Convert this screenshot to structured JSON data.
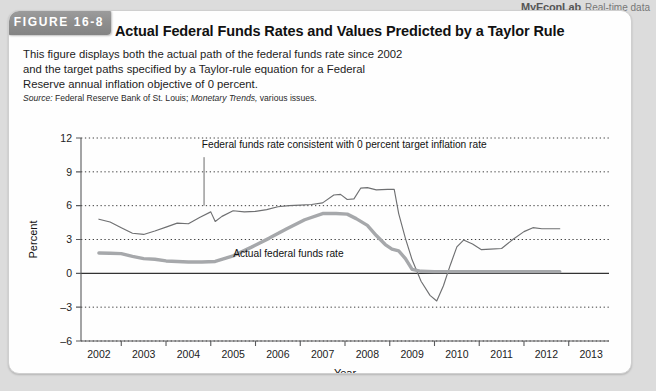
{
  "header": {
    "mel_brand": "MyEconLab",
    "mel_sub": "Real-time data",
    "figure_badge": "FIGURE 16-8",
    "title": "Actual Federal Funds Rates and Values Predicted by a Taylor Rule",
    "description": "This figure displays both the actual path of the federal funds rate since 2002 and the target paths specified by a Taylor-rule equation for a Federal Reserve annual inflation objective of 0 percent.",
    "source_label": "Source:",
    "source_text": "Federal Reserve Bank of St. Louis;",
    "source_italic": "Monetary Trends,",
    "source_tail": "various issues."
  },
  "chart_data": {
    "type": "line",
    "title": "Actual Federal Funds Rates and Values Predicted by a Taylor Rule",
    "xlabel": "Year",
    "ylabel": "Percent",
    "xlim": [
      2001.6,
      2013.4
    ],
    "ylim": [
      -6,
      12
    ],
    "yticks": [
      12,
      9,
      6,
      3,
      0,
      -3,
      -6
    ],
    "xticks": [
      2002,
      2003,
      2004,
      2005,
      2006,
      2007,
      2008,
      2009,
      2010,
      2011,
      2012,
      2013
    ],
    "grid": "horizontal-dotted",
    "legend": "annotations",
    "annotations": [
      {
        "name": "taylor-rule-label",
        "text": "Federal funds rate consistent with 0 percent target inflation rate",
        "x": 2004.3,
        "y": 11.1,
        "leader_x": 2004.35,
        "leader_y0": 10.3,
        "leader_y1": 6.0
      },
      {
        "name": "actual-rate-label",
        "text": "Actual federal funds rate",
        "x": 2005.0,
        "y": 1.45
      }
    ],
    "series": [
      {
        "name": "Federal funds rate consistent with 0 percent target inflation rate",
        "style": "thin",
        "color": "#6f7072",
        "points": [
          [
            2002.0,
            4.8
          ],
          [
            2002.25,
            4.55
          ],
          [
            2002.5,
            4.05
          ],
          [
            2002.75,
            3.55
          ],
          [
            2003.0,
            3.45
          ],
          [
            2003.25,
            3.75
          ],
          [
            2003.5,
            4.1
          ],
          [
            2003.75,
            4.45
          ],
          [
            2004.0,
            4.4
          ],
          [
            2004.25,
            4.95
          ],
          [
            2004.5,
            5.45
          ],
          [
            2004.6,
            4.6
          ],
          [
            2004.75,
            5.05
          ],
          [
            2005.0,
            5.55
          ],
          [
            2005.25,
            5.45
          ],
          [
            2005.5,
            5.5
          ],
          [
            2005.75,
            5.65
          ],
          [
            2006.0,
            5.9
          ],
          [
            2006.25,
            6.0
          ],
          [
            2006.5,
            6.05
          ],
          [
            2006.75,
            6.1
          ],
          [
            2007.0,
            6.25
          ],
          [
            2007.25,
            6.95
          ],
          [
            2007.4,
            7.0
          ],
          [
            2007.55,
            6.55
          ],
          [
            2007.7,
            6.6
          ],
          [
            2007.85,
            7.55
          ],
          [
            2008.0,
            7.6
          ],
          [
            2008.2,
            7.4
          ],
          [
            2008.45,
            7.45
          ],
          [
            2008.6,
            7.45
          ],
          [
            2008.7,
            5.3
          ],
          [
            2008.85,
            3.1
          ],
          [
            2009.0,
            1.2
          ],
          [
            2009.2,
            -0.7
          ],
          [
            2009.4,
            -1.95
          ],
          [
            2009.55,
            -2.45
          ],
          [
            2009.7,
            -1.1
          ],
          [
            2009.85,
            0.7
          ],
          [
            2010.0,
            2.35
          ],
          [
            2010.15,
            2.95
          ],
          [
            2010.35,
            2.6
          ],
          [
            2010.55,
            2.1
          ],
          [
            2010.75,
            2.15
          ],
          [
            2011.0,
            2.2
          ],
          [
            2011.25,
            3.0
          ],
          [
            2011.5,
            3.7
          ],
          [
            2011.7,
            4.05
          ],
          [
            2011.9,
            3.95
          ],
          [
            2012.1,
            3.95
          ],
          [
            2012.3,
            3.95
          ]
        ]
      },
      {
        "name": "Actual federal funds rate",
        "style": "thick",
        "color": "#a6a8ab",
        "points": [
          [
            2002.0,
            1.8
          ],
          [
            2002.25,
            1.78
          ],
          [
            2002.5,
            1.75
          ],
          [
            2002.75,
            1.5
          ],
          [
            2003.0,
            1.3
          ],
          [
            2003.25,
            1.25
          ],
          [
            2003.5,
            1.1
          ],
          [
            2003.75,
            1.05
          ],
          [
            2004.0,
            1.0
          ],
          [
            2004.3,
            1.0
          ],
          [
            2004.6,
            1.05
          ],
          [
            2005.0,
            1.55
          ],
          [
            2005.4,
            2.3
          ],
          [
            2005.8,
            3.1
          ],
          [
            2006.2,
            3.95
          ],
          [
            2006.6,
            4.75
          ],
          [
            2007.0,
            5.3
          ],
          [
            2007.3,
            5.3
          ],
          [
            2007.55,
            5.25
          ],
          [
            2007.75,
            4.85
          ],
          [
            2008.0,
            4.25
          ],
          [
            2008.2,
            3.35
          ],
          [
            2008.4,
            2.55
          ],
          [
            2008.55,
            2.15
          ],
          [
            2008.7,
            2.0
          ],
          [
            2008.85,
            1.3
          ],
          [
            2009.0,
            0.35
          ],
          [
            2009.2,
            0.18
          ],
          [
            2009.5,
            0.15
          ],
          [
            2010.0,
            0.15
          ],
          [
            2010.5,
            0.15
          ],
          [
            2011.0,
            0.15
          ],
          [
            2011.5,
            0.15
          ],
          [
            2012.0,
            0.15
          ],
          [
            2012.3,
            0.15
          ]
        ]
      }
    ],
    "zero_line": 0
  }
}
